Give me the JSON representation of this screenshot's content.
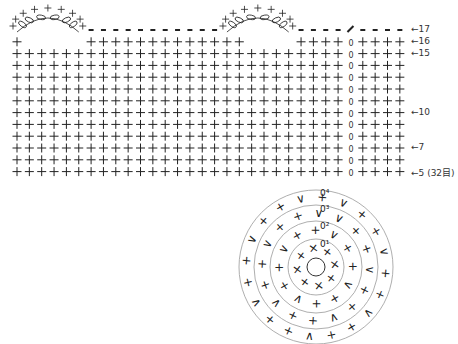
{
  "grid": {
    "columns": 32,
    "first_row": 5,
    "last_row": 17,
    "x0": 17,
    "dx": 12.35,
    "y_top": 30,
    "dy": 11.8,
    "marker_column": 27,
    "scallops": [
      {
        "start_col": 0,
        "end_col": 5
      },
      {
        "start_col": 17,
        "end_col": 22
      }
    ]
  },
  "row_labels": [
    {
      "row": 17,
      "text": "←17"
    },
    {
      "row": 16,
      "text": "←16"
    },
    {
      "row": 15,
      "text": "←15"
    },
    {
      "row": 10,
      "text": "←10"
    },
    {
      "row": 7,
      "text": "←7"
    },
    {
      "row": 5,
      "text": "←5 (32目)"
    }
  ],
  "round_chart": {
    "cx": 316,
    "cy": 267,
    "rings": [
      9,
      28,
      46,
      62,
      77
    ],
    "round_labels": [
      "0¹",
      "0²",
      "0³",
      "0⁴"
    ]
  },
  "symbols": {
    "single_crochet": "+",
    "increase": "V",
    "decrease": "Λ",
    "chain": "○",
    "slip_stitch": "●"
  }
}
